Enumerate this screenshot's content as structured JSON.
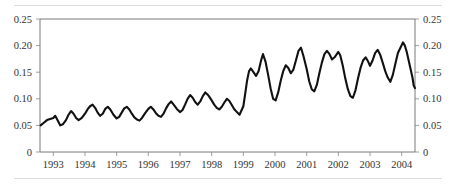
{
  "figure": {
    "name": "time-series-line-chart",
    "background_color": "#ffffff",
    "line_color": "#111111",
    "axis_color": "#7a7a7a",
    "rule_color": "#dcdcdc"
  },
  "chart_data": {
    "type": "line",
    "title": "",
    "subtitle": "",
    "xlabel": "",
    "ylabel": "",
    "grid": false,
    "legend": "none",
    "ylim": [
      0,
      0.25
    ],
    "xlim": [
      1992.58,
      2004.42
    ],
    "y_ticks": [
      0,
      0.05,
      0.1,
      0.15,
      0.2,
      0.25
    ],
    "y_tick_labels_left": [
      "0",
      "0.05",
      "0.10",
      "0.15",
      "0.20",
      "0.25"
    ],
    "y_tick_labels_right": [
      "0",
      "0.05",
      "0.10",
      "0.15",
      "0.20",
      "0.25"
    ],
    "y_axis_position": "both",
    "x_ticks": [
      1993,
      1994,
      1995,
      1996,
      1997,
      1998,
      1999,
      2000,
      2001,
      2002,
      2003,
      2004
    ],
    "x_tick_labels": [
      "1993",
      "1994",
      "1995",
      "1996",
      "1997",
      "1998",
      "1999",
      "2000",
      "2001",
      "2002",
      "2003",
      "2004"
    ],
    "series": [
      {
        "name": "series-1",
        "color": "#111111",
        "x": [
          1992.58,
          1992.67,
          1992.75,
          1992.83,
          1992.92,
          1993.0,
          1993.08,
          1993.17,
          1993.25,
          1993.33,
          1993.42,
          1993.5,
          1993.58,
          1993.67,
          1993.75,
          1993.83,
          1993.92,
          1994.0,
          1994.08,
          1994.17,
          1994.25,
          1994.33,
          1994.42,
          1994.5,
          1994.58,
          1994.67,
          1994.75,
          1994.83,
          1994.92,
          1995.0,
          1995.08,
          1995.17,
          1995.25,
          1995.33,
          1995.42,
          1995.5,
          1995.58,
          1995.67,
          1995.75,
          1995.83,
          1995.92,
          1996.0,
          1996.08,
          1996.17,
          1996.25,
          1996.33,
          1996.42,
          1996.5,
          1996.58,
          1996.67,
          1996.75,
          1996.83,
          1996.92,
          1997.0,
          1997.08,
          1997.17,
          1997.25,
          1997.33,
          1997.42,
          1997.5,
          1997.58,
          1997.67,
          1997.75,
          1997.83,
          1997.92,
          1998.0,
          1998.08,
          1998.17,
          1998.25,
          1998.33,
          1998.42,
          1998.5,
          1998.58,
          1998.67,
          1998.75,
          1998.83,
          1998.92,
          1999.0,
          1999.08,
          1999.17,
          1999.25,
          1999.33,
          1999.42,
          1999.5,
          1999.58,
          1999.67,
          1999.75,
          1999.83,
          1999.92,
          2000.0,
          2000.08,
          2000.17,
          2000.25,
          2000.33,
          2000.42,
          2000.5,
          2000.58,
          2000.67,
          2000.75,
          2000.83,
          2000.92,
          2001.0,
          2001.08,
          2001.17,
          2001.25,
          2001.33,
          2001.42,
          2001.5,
          2001.58,
          2001.67,
          2001.75,
          2001.83,
          2001.92,
          2002.0,
          2002.08,
          2002.17,
          2002.25,
          2002.33,
          2002.42,
          2002.5,
          2002.58,
          2002.67,
          2002.75,
          2002.83,
          2002.92,
          2003.0,
          2003.08,
          2003.17,
          2003.25,
          2003.33,
          2003.42,
          2003.5,
          2003.58,
          2003.67,
          2003.75,
          2003.83,
          2003.92,
          2004.0,
          2004.08,
          2004.17,
          2004.25,
          2004.33,
          2004.42
        ],
        "values": [
          0.05,
          0.053,
          0.057,
          0.06,
          0.062,
          0.063,
          0.067,
          0.06,
          0.054,
          0.052,
          0.058,
          0.066,
          0.072,
          0.075,
          0.07,
          0.064,
          0.061,
          0.064,
          0.069,
          0.074,
          0.079,
          0.082,
          0.084,
          0.08,
          0.074,
          0.068,
          0.066,
          0.072,
          0.078,
          0.082,
          0.079,
          0.073,
          0.067,
          0.063,
          0.066,
          0.072,
          0.078,
          0.082,
          0.079,
          0.074,
          0.068,
          0.063,
          0.06,
          0.064,
          0.071,
          0.078,
          0.082,
          0.079,
          0.075,
          0.07,
          0.065,
          0.061,
          0.059,
          0.064,
          0.072,
          0.079,
          0.083,
          0.08,
          0.076,
          0.071,
          0.067,
          0.07,
          0.077,
          0.084,
          0.088,
          0.085,
          0.08,
          0.076,
          0.073,
          0.078,
          0.086,
          0.093,
          0.097,
          0.093,
          0.087,
          0.082,
          0.08,
          0.083,
          0.09,
          0.098,
          0.104,
          0.101,
          0.095,
          0.089,
          0.085,
          0.09,
          0.098,
          0.106,
          0.112,
          0.109,
          0.103,
          0.097,
          0.092,
          0.09,
          0.096,
          0.103,
          0.108,
          0.105,
          0.1,
          0.095,
          0.091,
          0.088,
          0.085,
          0.09,
          0.097,
          0.102,
          0.1,
          0.096,
          0.091,
          0.087,
          0.083,
          0.08,
          0.078,
          0.082,
          0.09,
          0.097,
          0.102,
          0.099,
          0.094,
          0.089,
          0.085,
          0.088,
          0.095,
          0.101,
          0.098,
          0.092,
          0.086,
          0.081,
          0.077,
          0.082,
          0.094,
          0.112,
          0.132,
          0.148,
          0.155,
          0.152,
          0.145,
          0.15,
          0.162,
          0.175,
          0.183,
          0.176,
          0.162
        ],
        "values_note": "monthly-series"
      }
    ]
  },
  "axes": {
    "left": {
      "name": "left-value-axis",
      "labels": [
        "0.25",
        "0.20",
        "0.15",
        "0.10",
        "0.05",
        "0"
      ]
    },
    "right": {
      "name": "right-value-axis",
      "labels": [
        "0.25",
        "0.20",
        "0.15",
        "0.10",
        "0.05",
        "0"
      ]
    },
    "bottom": {
      "name": "year-axis",
      "labels": [
        "1993",
        "1994",
        "1995",
        "1996",
        "1997",
        "1998",
        "1999",
        "2000",
        "2001",
        "2002",
        "2003",
        "2004"
      ]
    }
  },
  "curve": {
    "points": [
      [
        1992.6,
        0.05
      ],
      [
        1992.7,
        0.055
      ],
      [
        1992.8,
        0.06
      ],
      [
        1992.9,
        0.062
      ],
      [
        1993.0,
        0.064
      ],
      [
        1993.06,
        0.068
      ],
      [
        1993.14,
        0.059
      ],
      [
        1993.22,
        0.05
      ],
      [
        1993.3,
        0.052
      ],
      [
        1993.4,
        0.06
      ],
      [
        1993.48,
        0.07
      ],
      [
        1993.56,
        0.077
      ],
      [
        1993.64,
        0.072
      ],
      [
        1993.72,
        0.064
      ],
      [
        1993.8,
        0.06
      ],
      [
        1993.9,
        0.064
      ],
      [
        1994.0,
        0.072
      ],
      [
        1994.08,
        0.08
      ],
      [
        1994.16,
        0.086
      ],
      [
        1994.24,
        0.089
      ],
      [
        1994.32,
        0.083
      ],
      [
        1994.4,
        0.074
      ],
      [
        1994.48,
        0.068
      ],
      [
        1994.56,
        0.072
      ],
      [
        1994.64,
        0.081
      ],
      [
        1994.72,
        0.085
      ],
      [
        1994.8,
        0.08
      ],
      [
        1994.9,
        0.07
      ],
      [
        1995.0,
        0.063
      ],
      [
        1995.08,
        0.066
      ],
      [
        1995.16,
        0.074
      ],
      [
        1995.24,
        0.082
      ],
      [
        1995.32,
        0.085
      ],
      [
        1995.4,
        0.08
      ],
      [
        1995.48,
        0.072
      ],
      [
        1995.56,
        0.065
      ],
      [
        1995.64,
        0.061
      ],
      [
        1995.72,
        0.059
      ],
      [
        1995.8,
        0.064
      ],
      [
        1995.9,
        0.073
      ],
      [
        1996.0,
        0.081
      ],
      [
        1996.08,
        0.085
      ],
      [
        1996.16,
        0.08
      ],
      [
        1996.24,
        0.073
      ],
      [
        1996.32,
        0.068
      ],
      [
        1996.4,
        0.066
      ],
      [
        1996.48,
        0.072
      ],
      [
        1996.56,
        0.082
      ],
      [
        1996.64,
        0.09
      ],
      [
        1996.72,
        0.095
      ],
      [
        1996.8,
        0.089
      ],
      [
        1996.9,
        0.081
      ],
      [
        1997.0,
        0.075
      ],
      [
        1997.08,
        0.079
      ],
      [
        1997.16,
        0.089
      ],
      [
        1997.24,
        0.1
      ],
      [
        1997.32,
        0.107
      ],
      [
        1997.4,
        0.102
      ],
      [
        1997.48,
        0.094
      ],
      [
        1997.56,
        0.089
      ],
      [
        1997.64,
        0.095
      ],
      [
        1997.72,
        0.105
      ],
      [
        1997.8,
        0.112
      ],
      [
        1997.9,
        0.106
      ],
      [
        1998.0,
        0.097
      ],
      [
        1998.08,
        0.089
      ],
      [
        1998.16,
        0.083
      ],
      [
        1998.24,
        0.08
      ],
      [
        1998.32,
        0.085
      ],
      [
        1998.4,
        0.093
      ],
      [
        1998.48,
        0.1
      ],
      [
        1998.56,
        0.096
      ],
      [
        1998.64,
        0.088
      ],
      [
        1998.72,
        0.08
      ],
      [
        1998.8,
        0.075
      ],
      [
        1998.88,
        0.07
      ],
      [
        1999.0,
        0.086
      ],
      [
        1999.06,
        0.11
      ],
      [
        1999.12,
        0.135
      ],
      [
        1999.18,
        0.152
      ],
      [
        1999.24,
        0.157
      ],
      [
        1999.32,
        0.15
      ],
      [
        1999.4,
        0.143
      ],
      [
        1999.48,
        0.152
      ],
      [
        1999.56,
        0.172
      ],
      [
        1999.62,
        0.184
      ],
      [
        1999.7,
        0.17
      ],
      [
        1999.78,
        0.146
      ],
      [
        1999.86,
        0.12
      ],
      [
        1999.94,
        0.1
      ],
      [
        2000.02,
        0.097
      ],
      [
        2000.1,
        0.112
      ],
      [
        2000.18,
        0.134
      ],
      [
        2000.26,
        0.152
      ],
      [
        2000.34,
        0.163
      ],
      [
        2000.42,
        0.158
      ],
      [
        2000.5,
        0.148
      ],
      [
        2000.58,
        0.155
      ],
      [
        2000.66,
        0.172
      ],
      [
        2000.74,
        0.19
      ],
      [
        2000.82,
        0.196
      ],
      [
        2000.9,
        0.18
      ],
      [
        2001.0,
        0.156
      ],
      [
        2001.08,
        0.133
      ],
      [
        2001.16,
        0.118
      ],
      [
        2001.24,
        0.114
      ],
      [
        2001.32,
        0.126
      ],
      [
        2001.4,
        0.148
      ],
      [
        2001.48,
        0.168
      ],
      [
        2001.56,
        0.184
      ],
      [
        2001.64,
        0.19
      ],
      [
        2001.72,
        0.184
      ],
      [
        2001.8,
        0.174
      ],
      [
        2001.88,
        0.178
      ],
      [
        2002.0,
        0.188
      ],
      [
        2002.06,
        0.182
      ],
      [
        2002.14,
        0.162
      ],
      [
        2002.22,
        0.138
      ],
      [
        2002.3,
        0.118
      ],
      [
        2002.38,
        0.105
      ],
      [
        2002.46,
        0.102
      ],
      [
        2002.54,
        0.116
      ],
      [
        2002.62,
        0.138
      ],
      [
        2002.7,
        0.158
      ],
      [
        2002.78,
        0.172
      ],
      [
        2002.86,
        0.178
      ],
      [
        2002.94,
        0.17
      ],
      [
        2003.0,
        0.162
      ],
      [
        2003.08,
        0.172
      ],
      [
        2003.16,
        0.186
      ],
      [
        2003.24,
        0.192
      ],
      [
        2003.32,
        0.183
      ],
      [
        2003.4,
        0.168
      ],
      [
        2003.48,
        0.152
      ],
      [
        2003.56,
        0.14
      ],
      [
        2003.64,
        0.132
      ],
      [
        2003.72,
        0.145
      ],
      [
        2003.8,
        0.166
      ],
      [
        2003.88,
        0.186
      ],
      [
        2003.96,
        0.196
      ],
      [
        2004.04,
        0.206
      ],
      [
        2004.1,
        0.2
      ],
      [
        2004.16,
        0.188
      ],
      [
        2004.22,
        0.172
      ],
      [
        2004.28,
        0.156
      ],
      [
        2004.34,
        0.14
      ],
      [
        2004.38,
        0.125
      ],
      [
        2004.42,
        0.12
      ]
    ]
  }
}
